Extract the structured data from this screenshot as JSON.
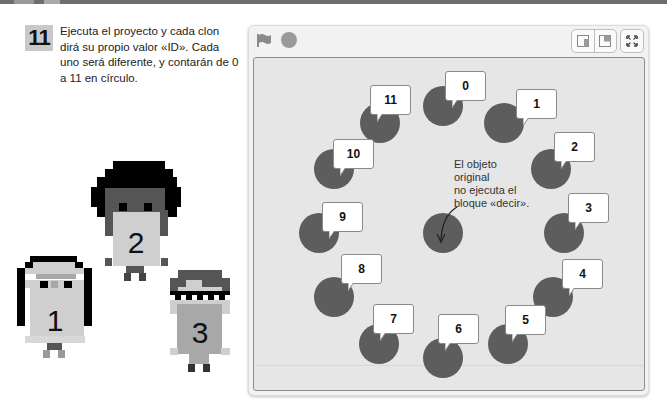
{
  "step": {
    "number": "11",
    "text": "Ejecuta el proyecto y cada clon dirá su propio valor «ID». Cada uno será diferente, y contarán de 0 a 11 en círculo."
  },
  "characters": [
    {
      "label": "1",
      "name": "character-one"
    },
    {
      "label": "2",
      "name": "character-two"
    },
    {
      "label": "3",
      "name": "character-three"
    }
  ],
  "stage": {
    "controls": {
      "green_flag": "green-flag-icon",
      "stop": "stop-icon",
      "small_stage": "small-stage-icon",
      "large_stage": "large-stage-icon",
      "fullscreen": "fullscreen-icon"
    },
    "note": "El objeto original no ejecuta el bloque «decir».",
    "note_lines": [
      "El objeto",
      "original",
      "no ejecuta el",
      "bloque «decir»."
    ],
    "clones": [
      {
        "id": "0",
        "label": "0"
      },
      {
        "id": "1",
        "label": "1"
      },
      {
        "id": "2",
        "label": "2"
      },
      {
        "id": "3",
        "label": "3"
      },
      {
        "id": "4",
        "label": "4"
      },
      {
        "id": "5",
        "label": "5"
      },
      {
        "id": "6",
        "label": "6"
      },
      {
        "id": "7",
        "label": "7"
      },
      {
        "id": "8",
        "label": "8"
      },
      {
        "id": "9",
        "label": "9"
      },
      {
        "id": "10",
        "label": "10"
      },
      {
        "id": "11",
        "label": "11"
      }
    ]
  },
  "colors": {
    "sprite": "#5d5d5d",
    "stage_bg": "#e6e6e6",
    "bubble_bg": "#ffffff",
    "badge_bg": "#c9c9c9"
  }
}
